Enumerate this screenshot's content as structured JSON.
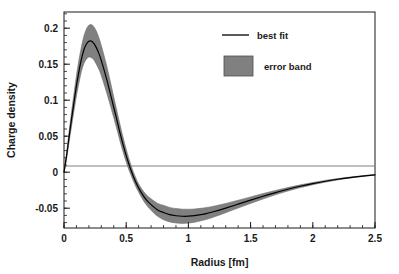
{
  "chart_data": {
    "type": "line",
    "title": "",
    "xlabel": "Radius [fm]",
    "ylabel": "Charge density",
    "xlim": [
      0,
      2.5
    ],
    "ylim": [
      -0.0775,
      0.2225
    ],
    "grid": false,
    "zero_line": true,
    "legend_position": "top-right",
    "x_ticks": [
      "0",
      "0.5",
      "1",
      "1.5",
      "2",
      "2.5"
    ],
    "x_tick_values": [
      0,
      0.5,
      1,
      1.5,
      2,
      2.5
    ],
    "x_minor_step": 0.1,
    "y_ticks": [
      "0.2",
      "0.15",
      "0.1",
      "0.05",
      "0",
      "-0.05"
    ],
    "y_tick_values": [
      0.2,
      0.15,
      0.1,
      0.05,
      0,
      -0.05
    ],
    "y_minor_step": 0.01,
    "series": [
      {
        "name": "best fit",
        "style": "line",
        "color": "#000000",
        "x": [
          0,
          0.02,
          0.04,
          0.06,
          0.08,
          0.1,
          0.12,
          0.14,
          0.16,
          0.18,
          0.2,
          0.22,
          0.24,
          0.26,
          0.28,
          0.3,
          0.34,
          0.38,
          0.42,
          0.46,
          0.5,
          0.54,
          0.58,
          0.62,
          0.66,
          0.7,
          0.75,
          0.8,
          0.85,
          0.9,
          0.95,
          1.0,
          1.05,
          1.1,
          1.15,
          1.2,
          1.3,
          1.4,
          1.5,
          1.6,
          1.7,
          1.8,
          1.9,
          2.0,
          2.1,
          2.2,
          2.3,
          2.4,
          2.5
        ],
        "values": [
          0.0,
          0.022,
          0.048,
          0.073,
          0.097,
          0.12,
          0.14,
          0.157,
          0.17,
          0.178,
          0.182,
          0.182,
          0.179,
          0.173,
          0.165,
          0.155,
          0.131,
          0.104,
          0.076,
          0.048,
          0.023,
          0.002,
          -0.015,
          -0.028,
          -0.038,
          -0.045,
          -0.052,
          -0.056,
          -0.059,
          -0.0605,
          -0.0612,
          -0.0611,
          -0.0603,
          -0.0589,
          -0.0571,
          -0.0549,
          -0.0498,
          -0.0443,
          -0.0388,
          -0.0334,
          -0.0283,
          -0.0237,
          -0.0195,
          -0.0158,
          -0.0126,
          -0.0098,
          -0.0074,
          -0.0054,
          -0.0036
        ]
      },
      {
        "name": "error band",
        "style": "band",
        "color": "#808080",
        "x": [
          0,
          0.02,
          0.04,
          0.06,
          0.08,
          0.1,
          0.12,
          0.14,
          0.16,
          0.18,
          0.2,
          0.22,
          0.24,
          0.26,
          0.28,
          0.3,
          0.34,
          0.38,
          0.42,
          0.46,
          0.5,
          0.54,
          0.58,
          0.62,
          0.66,
          0.7,
          0.75,
          0.8,
          0.85,
          0.9,
          0.95,
          1.0,
          1.05,
          1.1,
          1.15,
          1.2,
          1.3,
          1.4,
          1.5,
          1.6,
          1.7,
          1.8,
          1.9,
          2.0,
          2.1,
          2.2,
          2.3,
          2.4,
          2.5
        ],
        "upper": [
          0.0,
          0.026,
          0.055,
          0.083,
          0.109,
          0.134,
          0.156,
          0.174,
          0.189,
          0.199,
          0.204,
          0.205,
          0.202,
          0.196,
          0.187,
          0.176,
          0.15,
          0.12,
          0.089,
          0.059,
          0.032,
          0.009,
          -0.009,
          -0.022,
          -0.031,
          -0.037,
          -0.043,
          -0.046,
          -0.049,
          -0.0505,
          -0.0513,
          -0.0515,
          -0.0511,
          -0.0502,
          -0.0489,
          -0.0473,
          -0.0434,
          -0.0389,
          -0.0343,
          -0.0297,
          -0.0253,
          -0.0213,
          -0.0176,
          -0.0143,
          -0.0114,
          -0.0089,
          -0.0067,
          -0.0049,
          -0.0032
        ],
        "lower": [
          0.0,
          0.018,
          0.041,
          0.063,
          0.085,
          0.106,
          0.124,
          0.14,
          0.151,
          0.157,
          0.16,
          0.159,
          0.156,
          0.15,
          0.143,
          0.134,
          0.112,
          0.088,
          0.063,
          0.037,
          0.014,
          -0.005,
          -0.021,
          -0.034,
          -0.045,
          -0.053,
          -0.061,
          -0.066,
          -0.069,
          -0.0705,
          -0.0711,
          -0.0707,
          -0.0695,
          -0.0676,
          -0.0653,
          -0.0625,
          -0.0562,
          -0.0497,
          -0.0433,
          -0.0371,
          -0.0313,
          -0.0261,
          -0.0214,
          -0.0173,
          -0.0138,
          -0.0107,
          -0.0081,
          -0.0059,
          -0.004
        ]
      }
    ],
    "legend": [
      {
        "label": "best fit",
        "marker": "line",
        "color": "#000000"
      },
      {
        "label": "error band",
        "marker": "swatch",
        "color": "#808080"
      }
    ]
  },
  "colors": {
    "band": "#808080",
    "band_stroke": "#6e6e6e",
    "line": "#000000",
    "axis": "#1a1a1a",
    "zero_line": "#808080",
    "background": "#ffffff"
  }
}
